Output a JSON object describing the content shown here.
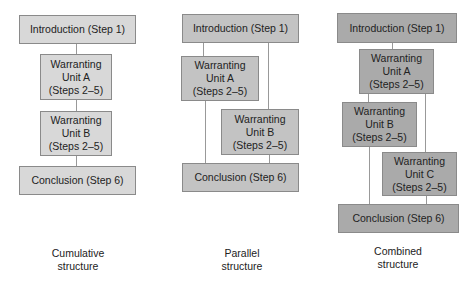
{
  "cumulative": {
    "intro": "Introduction (Step 1)",
    "unit_a": "Warranting\nUnit A\n(Steps 2–5)",
    "unit_b": "Warranting\nUnit B\n(Steps 2–5)",
    "conclusion": "Conclusion (Step 6)",
    "caption": "Cumulative\nstructure"
  },
  "parallel": {
    "intro": "Introduction (Step 1)",
    "unit_a": "Warranting\nUnit A\n(Steps 2–5)",
    "unit_b": "Warranting\nUnit B\n(Steps 2–5)",
    "conclusion": "Conclusion (Step 6)",
    "caption": "Parallel\nstructure"
  },
  "combined": {
    "intro": "Introduction (Step 1)",
    "unit_a": "Warranting\nUnit A\n(Steps 2–5)",
    "unit_b": "Warranting\nUnit B\n(Steps 2–5)",
    "unit_c": "Warranting\nUnit C\n(Steps 2–5)",
    "conclusion": "Conclusion (Step 6)",
    "caption": "Combined\nstructure"
  },
  "colors": {
    "cumulative_fill": "#d8d8d8",
    "parallel_fill": "#c3c3c3",
    "combined_fill": "#aaaaaa"
  }
}
